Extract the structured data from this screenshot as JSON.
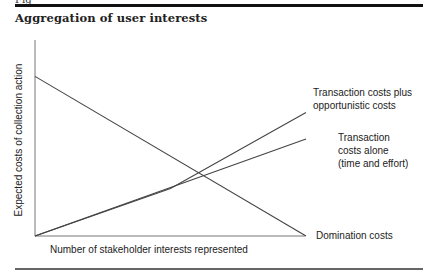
{
  "figure": {
    "label_partial": "Fig",
    "title": "Aggregation of user interests"
  },
  "chart_data": {
    "type": "line",
    "title": "Aggregation of user interests",
    "xlabel": "Number of stakeholder interests represented",
    "ylabel": "Expected costs of collection action",
    "axes_ticks": false,
    "grid": false,
    "x_range": [
      0,
      100
    ],
    "y_range": [
      0,
      100
    ],
    "series": [
      {
        "name": "Domination costs",
        "points": [
          [
            0,
            84
          ],
          [
            100,
            0
          ]
        ],
        "label_lines": [
          "Domination costs"
        ]
      },
      {
        "name": "Transaction costs alone (time and effort)",
        "points": [
          [
            0,
            0
          ],
          [
            100,
            51
          ]
        ],
        "label_lines": [
          "Transaction",
          "costs alone",
          "(time and effort)"
        ]
      },
      {
        "name": "Transaction costs plus opportunistic costs",
        "points": [
          [
            0,
            0
          ],
          [
            50,
            25
          ],
          [
            100,
            65
          ]
        ],
        "label_lines": [
          "Transaction costs plus",
          "opportunistic costs"
        ]
      }
    ]
  },
  "colors": {
    "line": "#444444",
    "axis": "#666666",
    "text": "#222222"
  }
}
